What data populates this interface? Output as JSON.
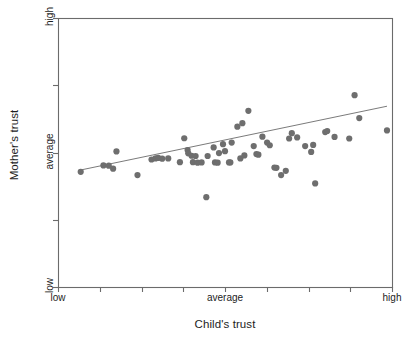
{
  "chart_data": {
    "type": "scatter",
    "title": "",
    "xlabel": "Child's trust",
    "ylabel": "Mother's trust",
    "x_tick_labels": [
      "low",
      "",
      "",
      "",
      "average",
      "",
      "",
      "",
      "high"
    ],
    "y_tick_labels": [
      "low",
      "",
      "average",
      "",
      "high"
    ],
    "x_tick_positions": [
      0,
      0.125,
      0.25,
      0.375,
      0.5,
      0.625,
      0.75,
      0.875,
      1
    ],
    "y_tick_positions": [
      0,
      0.25,
      0.5,
      0.75,
      1
    ],
    "xlim": [
      0,
      1
    ],
    "ylim": [
      0,
      1
    ],
    "grid": false,
    "legend": false,
    "point_color": "#6e6e6e",
    "point_radius": 3.1,
    "frame_color": "#6b6b6b",
    "trendline": {
      "name": "regression line",
      "color": "#6b6b6b",
      "x_start": 0.068,
      "y_start": 0.435,
      "x_end": 0.985,
      "y_end": 0.672
    },
    "series": [
      {
        "name": "mother-child trust pairs",
        "points": [
          [
            0.068,
            0.428
          ],
          [
            0.136,
            0.452
          ],
          [
            0.152,
            0.451
          ],
          [
            0.165,
            0.44
          ],
          [
            0.175,
            0.504
          ],
          [
            0.238,
            0.416
          ],
          [
            0.28,
            0.474
          ],
          [
            0.292,
            0.478
          ],
          [
            0.3,
            0.48
          ],
          [
            0.312,
            0.477
          ],
          [
            0.33,
            0.478
          ],
          [
            0.365,
            0.464
          ],
          [
            0.378,
            0.553
          ],
          [
            0.388,
            0.509
          ],
          [
            0.39,
            0.497
          ],
          [
            0.4,
            0.488
          ],
          [
            0.404,
            0.464
          ],
          [
            0.412,
            0.487
          ],
          [
            0.418,
            0.462
          ],
          [
            0.43,
            0.463
          ],
          [
            0.444,
            0.334
          ],
          [
            0.448,
            0.487
          ],
          [
            0.466,
            0.519
          ],
          [
            0.47,
            0.463
          ],
          [
            0.478,
            0.462
          ],
          [
            0.482,
            0.498
          ],
          [
            0.494,
            0.531
          ],
          [
            0.5,
            0.505
          ],
          [
            0.512,
            0.463
          ],
          [
            0.516,
            0.463
          ],
          [
            0.52,
            0.537
          ],
          [
            0.537,
            0.596
          ],
          [
            0.546,
            0.478
          ],
          [
            0.552,
            0.609
          ],
          [
            0.558,
            0.489
          ],
          [
            0.57,
            0.655
          ],
          [
            0.586,
            0.524
          ],
          [
            0.594,
            0.494
          ],
          [
            0.6,
            0.492
          ],
          [
            0.612,
            0.559
          ],
          [
            0.626,
            0.537
          ],
          [
            0.634,
            0.527
          ],
          [
            0.648,
            0.444
          ],
          [
            0.654,
            0.443
          ],
          [
            0.668,
            0.416
          ],
          [
            0.682,
            0.432
          ],
          [
            0.692,
            0.552
          ],
          [
            0.7,
            0.572
          ],
          [
            0.716,
            0.556
          ],
          [
            0.74,
            0.524
          ],
          [
            0.758,
            0.502
          ],
          [
            0.764,
            0.528
          ],
          [
            0.77,
            0.385
          ],
          [
            0.8,
            0.576
          ],
          [
            0.806,
            0.58
          ],
          [
            0.828,
            0.558
          ],
          [
            0.872,
            0.552
          ],
          [
            0.888,
            0.713
          ],
          [
            0.902,
            0.628
          ],
          [
            0.985,
            0.582
          ]
        ]
      }
    ]
  },
  "axes": {
    "plot_left": 58,
    "plot_top": 18,
    "plot_right": 392,
    "plot_bottom": 287
  }
}
